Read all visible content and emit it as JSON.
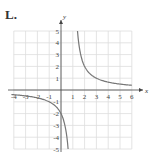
{
  "panel_label": "L.",
  "chart_data": {
    "type": "line",
    "title": "",
    "xlabel": "x",
    "ylabel": "y",
    "xlim": [
      -4,
      6
    ],
    "ylim": [
      -5,
      5
    ],
    "grid": true,
    "x_ticks": [
      "-4",
      "-3",
      "-2",
      "-1",
      "1",
      "2",
      "3",
      "4",
      "5",
      "6"
    ],
    "y_ticks": [
      "5",
      "4",
      "3",
      "2",
      "1",
      "-1",
      "-2",
      "-3",
      "-4",
      "-5"
    ],
    "series": [
      {
        "name": "rational function (hyperbola)",
        "description": "vertical asymptote x=1, horizontal asymptote y=0, y-intercept -2",
        "x": [
          -4,
          -3,
          -2,
          -1,
          0,
          0.5,
          0.6,
          1.4,
          1.5,
          2,
          3,
          4,
          5,
          6
        ],
        "y": [
          -0.4,
          -0.5,
          -0.67,
          -1,
          -2,
          -4,
          -5,
          5,
          4,
          2,
          1,
          0.67,
          0.5,
          0.4
        ]
      }
    ],
    "colors": {
      "curve": "#777777",
      "grid": "#dddddd",
      "axes": "#444444"
    }
  }
}
